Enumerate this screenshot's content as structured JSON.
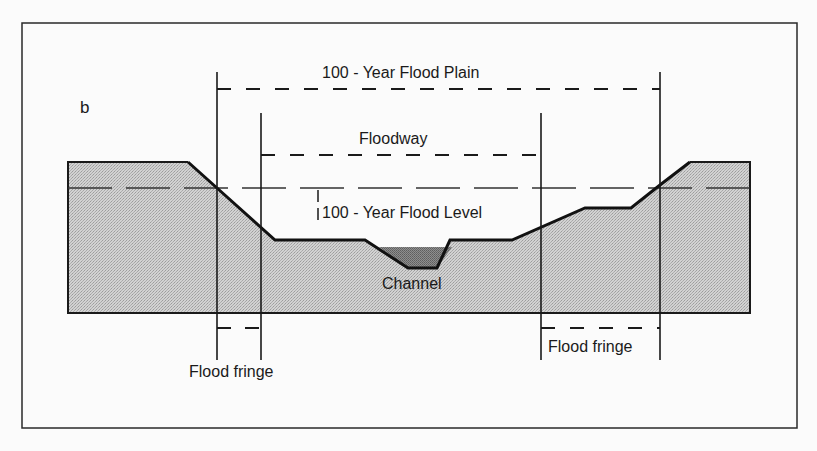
{
  "figure": {
    "panel_label": "b",
    "labels": {
      "flood_plain": "100 - Year Flood Plain",
      "floodway": "Floodway",
      "flood_level": "100 - Year Flood Level",
      "channel": "Channel",
      "flood_fringe_left": "Flood fringe",
      "flood_fringe_right": "Flood fringe"
    },
    "colors": {
      "frame": "#2a2a2a",
      "ground_fill": "#c8c8c8",
      "channel_fill": "#8a8a8a",
      "line": "#1a1a1a",
      "background": "#fbfbfb"
    }
  }
}
